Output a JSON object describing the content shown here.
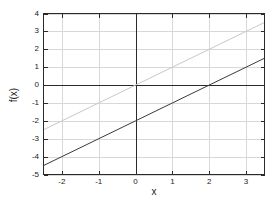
{
  "chart_data": {
    "type": "line",
    "title": "",
    "xlabel": "x",
    "ylabel": "f(x)",
    "xlim": [
      -2.5,
      3.5
    ],
    "ylim": [
      -5,
      4
    ],
    "xticks": [
      -2,
      -1,
      0,
      1,
      2,
      3
    ],
    "xtick_labels": [
      "-2",
      "-1",
      "0",
      "1",
      "2",
      "3"
    ],
    "yticks": [
      -5,
      -4,
      -3,
      -2,
      -1,
      0,
      1,
      2,
      3,
      4
    ],
    "ytick_labels": [
      "-5",
      "-4",
      "-3",
      "-2",
      "-1",
      "0",
      "1",
      "2",
      "3",
      "4"
    ],
    "grid": true,
    "legend": "none",
    "series": [
      {
        "name": "line-light",
        "color": "#c8c8c8",
        "style": "solid",
        "width": 1,
        "slope": 1.0,
        "intercept": 0.0,
        "points": [
          {
            "x": -2.5,
            "y": -2.5
          },
          {
            "x": 0.0,
            "y": 0.0
          },
          {
            "x": 3.5,
            "y": 3.5
          }
        ]
      },
      {
        "name": "line-dark",
        "color": "#3a3a3a",
        "style": "solid",
        "width": 1,
        "slope": 1.0,
        "intercept": -2.0,
        "points": [
          {
            "x": -2.5,
            "y": -4.5
          },
          {
            "x": 0.0,
            "y": -2.0
          },
          {
            "x": 2.0,
            "y": 0.0
          },
          {
            "x": 3.5,
            "y": 1.5
          }
        ]
      }
    ],
    "axis_lines": {
      "x_zero_line": true,
      "y_zero_line": true,
      "color": "#2a2a2a"
    },
    "frame": {
      "color": "#2a2a2a",
      "width": 1
    },
    "gridline_color": "#d8d8d8",
    "background": "#ffffff"
  }
}
